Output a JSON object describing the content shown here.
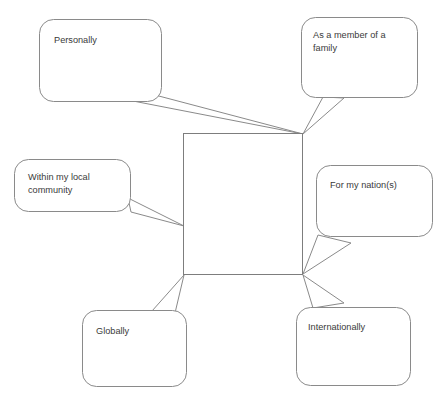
{
  "diagram": {
    "type": "spider-bubble-diagram",
    "background_color": "#ffffff",
    "stroke_color": "#8a8a8a",
    "text_color": "#3a3a3a",
    "center": {
      "label": "",
      "x": 183,
      "y": 133,
      "width": 120,
      "height": 142
    },
    "bubbles": [
      {
        "id": "personally",
        "lines": [
          "Personally"
        ],
        "anchor": "top-right-corner"
      },
      {
        "id": "family",
        "lines": [
          "As a member of a",
          "family"
        ],
        "anchor": "top-right-corner"
      },
      {
        "id": "local-community",
        "lines": [
          "Within my local",
          "community"
        ],
        "anchor": "left-edge"
      },
      {
        "id": "nation",
        "lines": [
          "For my nation(s)"
        ],
        "anchor": "bottom-right-corner"
      },
      {
        "id": "globally",
        "lines": [
          "Globally"
        ],
        "anchor": "bottom-left-corner"
      },
      {
        "id": "internationally",
        "lines": [
          "Internationally"
        ],
        "anchor": "bottom-right-corner"
      }
    ]
  },
  "footer": {
    "smudge": ""
  }
}
